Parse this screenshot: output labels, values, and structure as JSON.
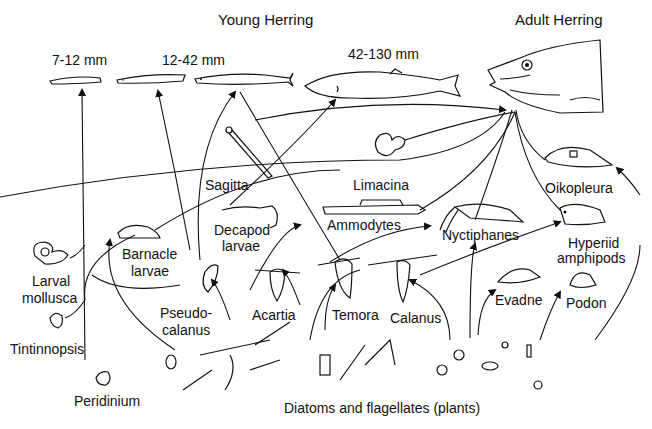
{
  "diagram": {
    "title_young": "Young Herring",
    "title_adult": "Adult Herring",
    "sizes": {
      "s1": "7-12 mm",
      "s2": "12-42 mm",
      "s3": "42-130 mm"
    },
    "organisms": {
      "sagitta": "Sagitta",
      "limacina": "Limacina",
      "oikopleura": "Oikopleura",
      "decapod_1": "Decapod",
      "decapod_2": "larvae",
      "ammodytes": "Ammodytes",
      "nyctiphanes": "Nyctiphanes",
      "hyperiid_1": "Hyperiid",
      "hyperiid_2": "amphipods",
      "barnacle_1": "Barnacle",
      "barnacle_2": "larvae",
      "larval_1": "Larval",
      "larval_2": "mollusca",
      "pseudo_1": "Pseudo-",
      "pseudo_2": "calanus",
      "acartia": "Acartia",
      "temora": "Temora",
      "calanus": "Calanus",
      "evadne": "Evadne",
      "podon": "Podon",
      "tintinnopsis": "Tintinnopsis",
      "peridinium": "Peridinium"
    },
    "base_label": "Diatoms and flagellates (plants)"
  }
}
